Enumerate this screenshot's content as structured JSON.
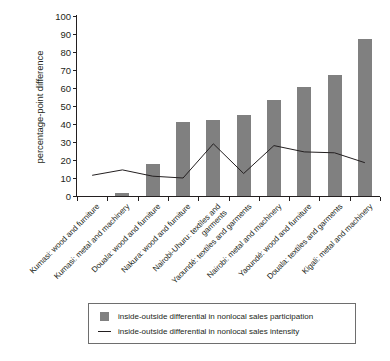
{
  "chart_data": {
    "type": "bar",
    "title": "",
    "subtitle": "",
    "xlabel": "",
    "ylabel": "percentage-point difference",
    "ylim": [
      0,
      100
    ],
    "yticks": [
      0,
      10,
      20,
      30,
      40,
      50,
      60,
      70,
      80,
      90,
      100
    ],
    "grid": false,
    "legend_position": "bottom",
    "categories": [
      "Kumasi: wood and furniture",
      "Kumasi: metal and machinery",
      "Douala: wood and furniture",
      "Nakura: wood and furniture",
      "Nairobi-Uhuru: textiles and\ngarments",
      "Yaoundé: textiles and garments",
      "Nairobi: metal and machinery",
      "Yaoundé: wood and furniture",
      "Douala: textiles and garments",
      "Kigali: metal and machinery"
    ],
    "series": [
      {
        "name": "inside-outside differential in nonlocal sales participation",
        "type": "bar",
        "color": "#808080",
        "values": [
          0,
          1.5,
          18,
          41,
          42.5,
          45,
          53.5,
          60.5,
          67,
          87
        ]
      },
      {
        "name": "inside-outside differential in nonlocal sales intensity",
        "type": "line",
        "color": "#231f20",
        "values": [
          11.5,
          14.5,
          11,
          10,
          29,
          12.5,
          28,
          24.5,
          24,
          18.5
        ]
      }
    ]
  },
  "legend": {
    "entries": [
      {
        "marker": "bar-swatch",
        "label": "inside-outside differential in nonlocal sales participation"
      },
      {
        "marker": "line-swatch",
        "label": "inside-outside differential in nonlocal sales intensity"
      }
    ]
  },
  "axis": {
    "y_title": "percentage-point difference"
  }
}
